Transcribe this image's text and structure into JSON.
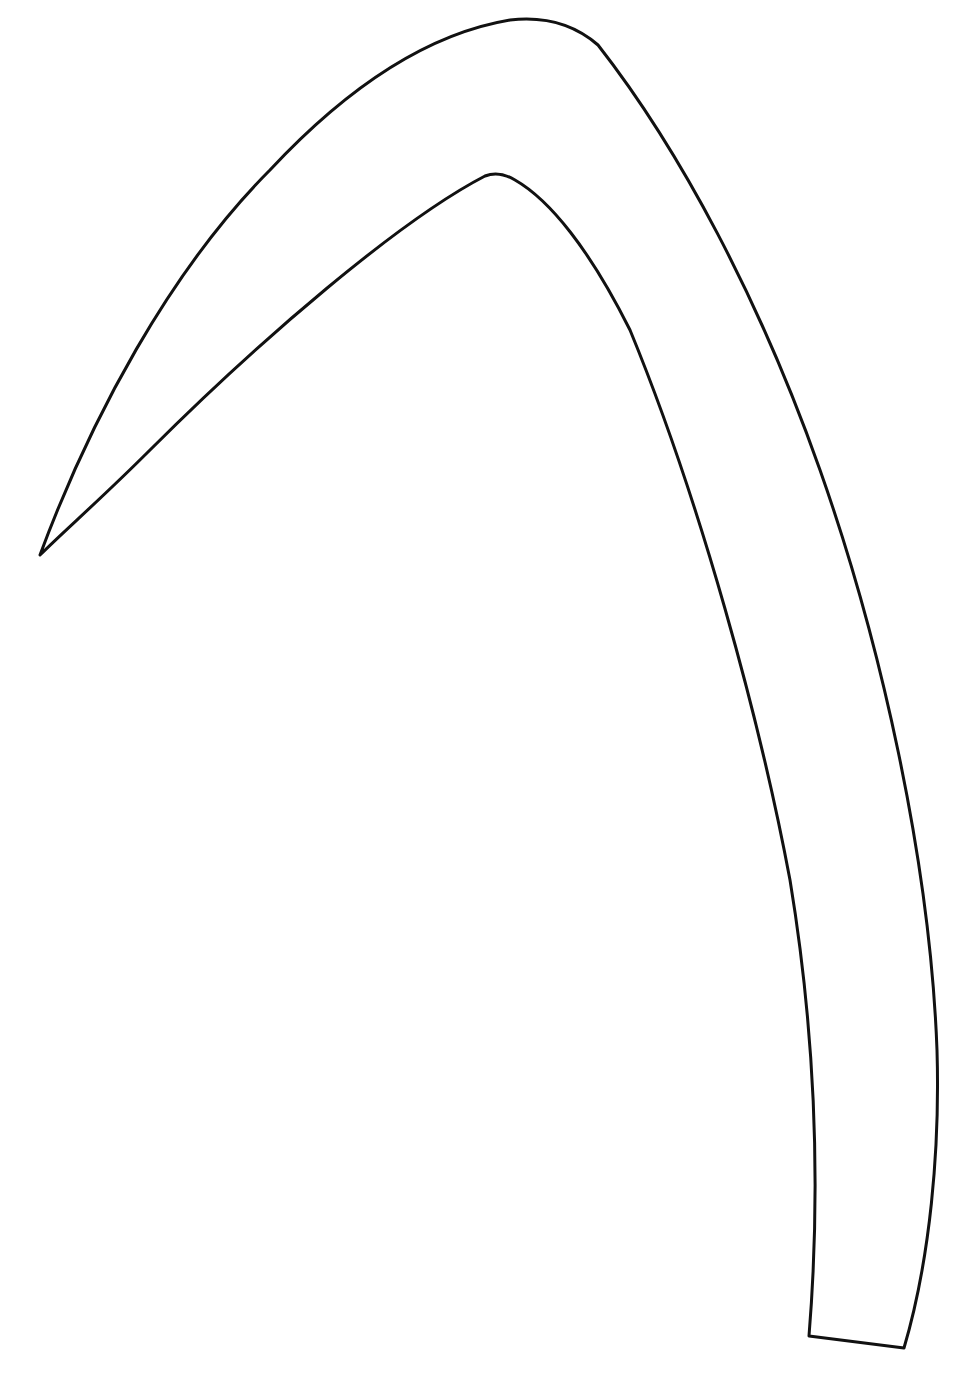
{
  "figure": {
    "stroke_color": "#111111",
    "background_color": "#ffffff",
    "stroke_width": 3
  },
  "shape": {
    "name": "curved-blade-outline",
    "tip": [
      40,
      555
    ],
    "outer_apex": [
      520,
      20
    ],
    "inner_apex": [
      492,
      173
    ],
    "base_left": [
      809,
      1336
    ],
    "base_right": [
      904,
      1348
    ]
  }
}
